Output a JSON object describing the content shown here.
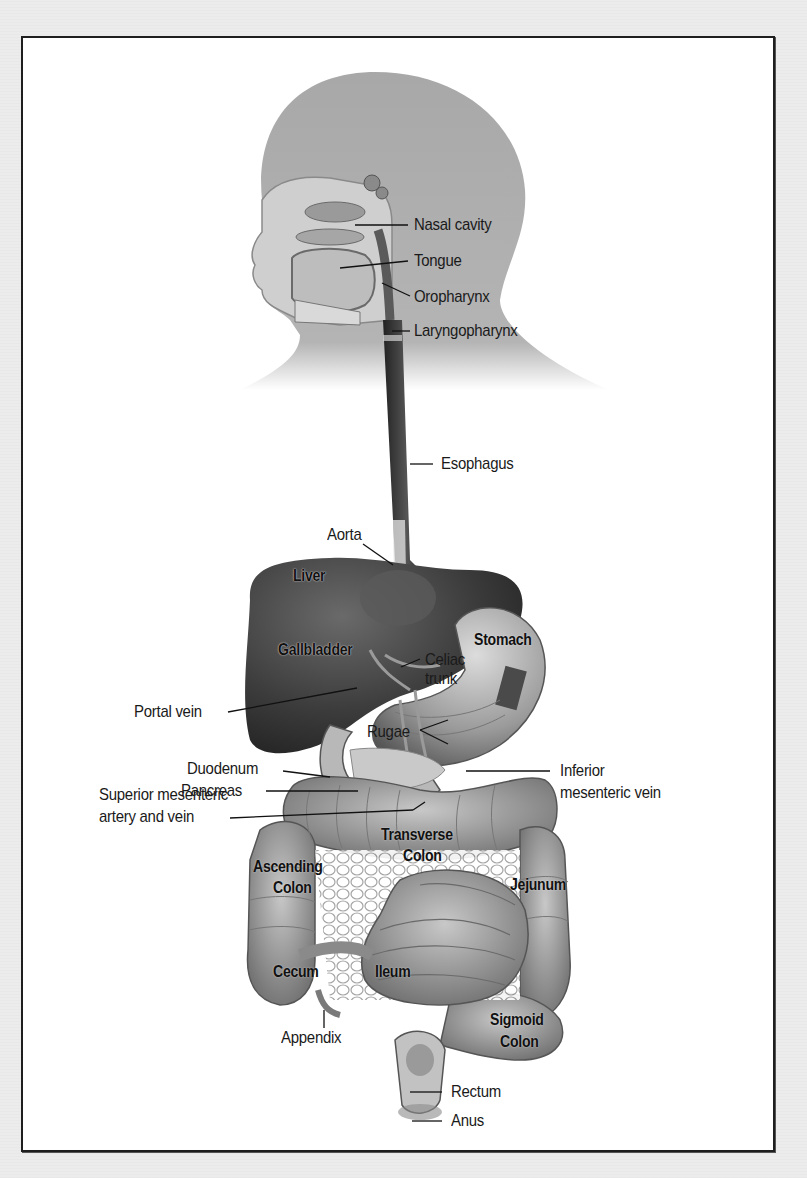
{
  "figure": {
    "colors": {
      "page_background": "#ececec",
      "frame_background": "#ffffff",
      "frame_border": "#1e1e1e",
      "head_silhouette": "#a6a6a6",
      "organ_dark": "#3a3a3a",
      "organ_mid": "#8a8a8a",
      "label_text": "#1a1a1a"
    },
    "labels": {
      "nasal_cavity": "Nasal cavity",
      "tongue": "Tongue",
      "oropharynx": "Oropharynx",
      "laryngopharynx": "Laryngopharynx",
      "esophagus": "Esophagus",
      "aorta": "Aorta",
      "liver": "Liver",
      "gallbladder": "Gallbladder",
      "stomach": "Stomach",
      "celiac_trunk_1": "Celiac",
      "celiac_trunk_2": "trunk",
      "portal_vein": "Portal vein",
      "rugae": "Rugae",
      "duodenum": "Duodenum",
      "pancreas": "Pancreas",
      "inferior_mesenteric_1": "Inferior",
      "inferior_mesenteric_2": "mesenteric vein",
      "superior_mesenteric_1": "Superior mesenteric",
      "superior_mesenteric_2": "artery and vein",
      "transverse_colon_1": "Transverse",
      "transverse_colon_2": "Colon",
      "ascending_colon_1": "Ascending",
      "ascending_colon_2": "Colon",
      "jejunum": "Jejunum",
      "cecum": "Cecum",
      "ileum": "Ileum",
      "appendix": "Appendix",
      "sigmoid_colon_1": "Sigmoid",
      "sigmoid_colon_2": "Colon",
      "rectum": "Rectum",
      "anus": "Anus"
    }
  }
}
